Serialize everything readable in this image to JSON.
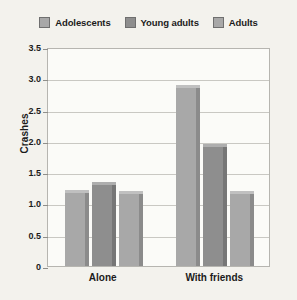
{
  "chart_data": {
    "type": "bar",
    "title": "",
    "xlabel": "",
    "ylabel": "Crashes",
    "categories": [
      "Alone",
      "With friends"
    ],
    "series": [
      {
        "name": "Adolescents",
        "values": [
          1.22,
          2.9
        ],
        "color": "#a8a8a8"
      },
      {
        "name": "Young adults",
        "values": [
          1.35,
          1.95
        ],
        "color": "#8e8e8e"
      },
      {
        "name": "Adults",
        "values": [
          1.2,
          1.2
        ],
        "color": "#a8a8a8"
      }
    ],
    "ylim": [
      0,
      3.5
    ],
    "ytick_step": 0.5,
    "ytick_labels": [
      "3.5",
      "3.0",
      "2.5",
      "2.0",
      "1.5",
      "1.0",
      "0.5",
      "0"
    ],
    "ytick_values": [
      3.5,
      3.0,
      2.5,
      2.0,
      1.5,
      1.0,
      0.5,
      0
    ],
    "grid": true,
    "legend_position": "top-center"
  },
  "legend": {
    "entries": [
      {
        "label": "Adolescents"
      },
      {
        "label": "Young adults"
      },
      {
        "label": "Adults"
      }
    ]
  },
  "colors": {
    "background": "#f3f2ed",
    "plot_background": "#fbfbf8",
    "gridline": "#c9c8c3",
    "frame": "#b6b5b0",
    "text": "#1b1b1b",
    "series_light": "#a8a8a8",
    "series_dark": "#8e8e8e"
  }
}
